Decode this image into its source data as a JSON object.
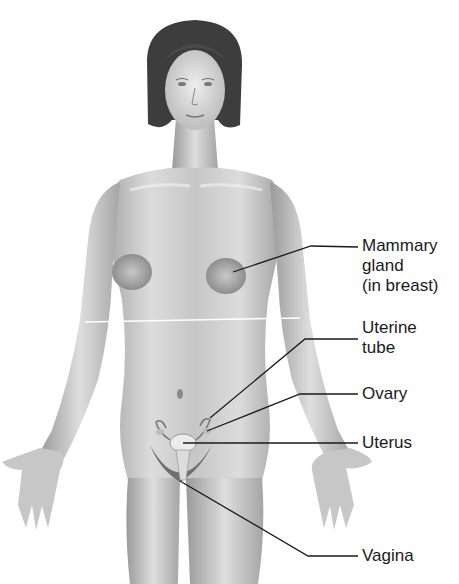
{
  "figure": {
    "colors": {
      "line": "#1a1a1a",
      "skin": "#d9d9d9",
      "shade": "#9a9a9a",
      "hair": "#3a3a3a",
      "background": "#ffffff"
    }
  },
  "labels": [
    {
      "id": "mammary",
      "text": "Mammary\ngland\n(in breast)",
      "top": 236,
      "leader": {
        "start": [
          233,
          272
        ],
        "elbow": [
          311,
          246
        ],
        "end": [
          358,
          247
        ]
      }
    },
    {
      "id": "uterine-tube",
      "text": "Uterine\ntube",
      "top": 318,
      "leader": {
        "start": [
          210,
          418
        ],
        "elbow": [
          305,
          339
        ],
        "end": [
          358,
          339
        ]
      }
    },
    {
      "id": "ovary",
      "text": "Ovary",
      "top": 384,
      "leader": {
        "start": [
          207,
          431
        ],
        "elbow": [
          300,
          394
        ],
        "end": [
          358,
          394
        ]
      }
    },
    {
      "id": "uterus",
      "text": "Uterus",
      "top": 430,
      "leader": {
        "start": [
          183,
          443
        ],
        "elbow": [
          300,
          443
        ],
        "end": [
          358,
          443
        ]
      }
    },
    {
      "id": "vagina",
      "text": "Vagina",
      "top": 545,
      "leader": {
        "start": [
          180,
          481
        ],
        "elbow": [
          308,
          556
        ],
        "end": [
          358,
          556
        ]
      }
    }
  ]
}
